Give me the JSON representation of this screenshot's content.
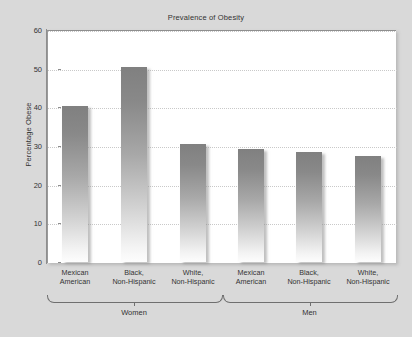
{
  "chart_data": {
    "type": "bar",
    "title": "Prevalence of Obesity",
    "xlabel": "",
    "ylabel": "Percentage Obese",
    "ylim": [
      0,
      60
    ],
    "ytick_labels": [
      "0",
      "10",
      "20",
      "30",
      "40",
      "50",
      "60"
    ],
    "ytick_values": [
      0,
      10,
      20,
      30,
      40,
      50,
      60
    ],
    "grid": true,
    "legend": "none",
    "categories": [
      "Mexican American",
      "Black, Non-Hispanic",
      "White, Non-Hispanic",
      "Mexican American",
      "Black, Non-Hispanic",
      "White, Non-Hispanic"
    ],
    "category_lines": [
      [
        "Mexican",
        "American"
      ],
      [
        "Black,",
        "Non-Hispanic"
      ],
      [
        "White,",
        "Non-Hispanic"
      ],
      [
        "Mexican",
        "American"
      ],
      [
        "Black,",
        "Non-Hispanic"
      ],
      [
        "White,",
        "Non-Hispanic"
      ]
    ],
    "values": [
      40.4,
      50.5,
      30.4,
      29.2,
      28.5,
      27.5
    ],
    "groups": [
      {
        "label": "Women",
        "bar_indices": [
          0,
          1,
          2
        ]
      },
      {
        "label": "Men",
        "bar_indices": [
          3,
          4,
          5
        ]
      }
    ],
    "colors": {
      "bar_top": "#808080",
      "bar_bottom": "#fdfdfd",
      "plot_background": "#ffffff",
      "figure_background": "#d9d9d9",
      "gridline": "#c9c9c9",
      "axis": "#8e8e8e",
      "text": "#333333"
    }
  }
}
